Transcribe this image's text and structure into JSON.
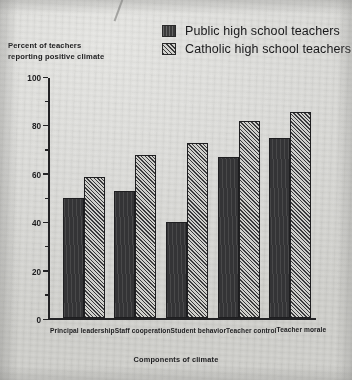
{
  "legend": {
    "items": [
      {
        "label": "Public high school teachers",
        "pattern": "solid",
        "color": "#343436"
      },
      {
        "label": "Catholic high school teachers",
        "pattern": "hatch",
        "color": "#cfcfcb"
      }
    ]
  },
  "axes": {
    "ylabel_line1": "Percent of teachers",
    "ylabel_line2": "reporting positive climate",
    "xlabel": "Components of climate",
    "yticks": [
      0,
      20,
      40,
      60,
      80,
      100
    ],
    "yticks_text": [
      "0",
      "20",
      "40",
      "60",
      "80",
      "100"
    ],
    "minor_tick_step": 10
  },
  "chart_data": {
    "type": "bar",
    "title": "",
    "xlabel": "Components of climate",
    "ylabel": "Percent of teachers reporting positive climate",
    "ylim": [
      0,
      100
    ],
    "grid": false,
    "legend_position": "top-right",
    "categories": [
      "Principal leadership",
      "Staff cooperation",
      "Student behavior",
      "Teacher control",
      "Teacher morale"
    ],
    "series": [
      {
        "name": "Public high school teachers",
        "values": [
          50,
          53,
          40,
          67,
          75
        ]
      },
      {
        "name": "Catholic high school teachers",
        "values": [
          59,
          68,
          73,
          82,
          86
        ]
      }
    ]
  }
}
